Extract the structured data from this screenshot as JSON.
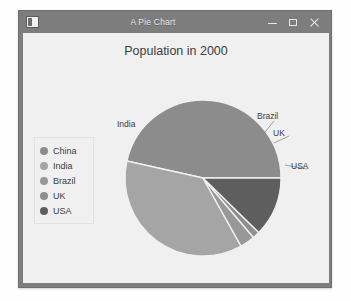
{
  "window": {
    "title": "A Pie Chart",
    "icon": "application-icon",
    "buttons": [
      {
        "name": "minimize-button",
        "glyph": "minimize"
      },
      {
        "name": "maximize-button",
        "glyph": "maximize"
      },
      {
        "name": "close-button",
        "glyph": "close"
      }
    ]
  },
  "colors": {
    "titlebar": "#7d7d7d",
    "canvas": "#f0f0f0",
    "text": "#3c3c3c",
    "china": "#8c8c8c",
    "india": "#a5a5a5",
    "brazil": "#989898",
    "uk": "#8f8f8f",
    "usa": "#5e5e5e",
    "slice_edge": "#f0f0f0"
  },
  "legend": {
    "name": "chart-legend",
    "items": [
      {
        "label": "China",
        "color": "#8c8c8c"
      },
      {
        "label": "India",
        "color": "#a5a5a5"
      },
      {
        "label": "Brazil",
        "color": "#989898"
      },
      {
        "label": "UK",
        "color": "#8f8f8f"
      },
      {
        "label": "USA",
        "color": "#5e5e5e"
      }
    ]
  },
  "chart_data": {
    "type": "pie",
    "title": "Population in 2000",
    "subtitle": "",
    "xlabel": "",
    "ylabel": "",
    "categories": [
      "China",
      "India",
      "Brazil",
      "UK",
      "USA"
    ],
    "values": [
      46.5,
      36.6,
      3.1,
      1.5,
      12.3
    ],
    "unit": "percent",
    "start_angle": 0,
    "direction": "counterclockwise",
    "legend_position": "left",
    "grid": false,
    "labels": [
      {
        "text": "India",
        "category": "India",
        "x": 115,
        "y": 93
      },
      {
        "text": "Brazil",
        "category": "Brazil",
        "x": 253,
        "y": 84
      },
      {
        "text": "UK",
        "category": "UK",
        "x": 268,
        "y": 101
      },
      {
        "text": "USA",
        "category": "USA",
        "x": 286,
        "y": 134
      },
      {
        "text": "China",
        "category": "China",
        "x": 209,
        "y": 266
      }
    ]
  }
}
